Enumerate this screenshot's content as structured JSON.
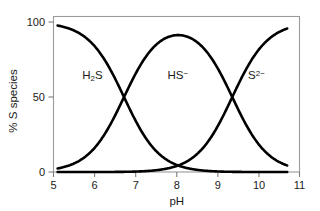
{
  "chart_data": {
    "type": "line",
    "title": "",
    "subtitle": "",
    "xlabel": "pH",
    "ylabel": "% S species",
    "xlim": [
      5,
      11
    ],
    "ylim": [
      0,
      100
    ],
    "xticks": [
      "5",
      "6",
      "7",
      "8",
      "9",
      "10",
      "11"
    ],
    "xtick_values": [
      5,
      6,
      7,
      8,
      9,
      10,
      11
    ],
    "yticks": [
      "0",
      "50",
      "100"
    ],
    "ytick_values": [
      0,
      50,
      100
    ],
    "grid": false,
    "legend": "none",
    "x_domain_drawn": [
      5.1,
      10.7
    ],
    "annotations": [
      {
        "id": "h2s",
        "text_html": "H<sub>2</sub>S",
        "text": "H2S",
        "x": 5.95,
        "y": 62
      },
      {
        "id": "hs-",
        "text_html": "HS<sup>−</sup>",
        "text": "HS-",
        "x": 8.03,
        "y": 62
      },
      {
        "id": "s2-",
        "text_html": "S<sup>2−</sup>",
        "text": "S2-",
        "x": 9.95,
        "y": 62
      }
    ],
    "series": [
      {
        "name": "H2S",
        "label_html": "H<sub>2</sub>S",
        "color": "#000000",
        "pka": 6.72,
        "shape": "descending sigmoid",
        "x": [
          5.1,
          5.3,
          5.5,
          5.7,
          5.9,
          6.1,
          6.3,
          6.5,
          6.72,
          6.9,
          7.1,
          7.3,
          7.5,
          7.7,
          7.9,
          8.1,
          8.3,
          8.6,
          9.0,
          9.5,
          10.0,
          10.7
        ],
        "values": [
          97.6,
          96.3,
          94.3,
          91.3,
          86.9,
          80.6,
          72.5,
          62.5,
          50.0,
          39.8,
          29.5,
          20.8,
          14.2,
          9.4,
          6.1,
          4.0,
          2.6,
          1.3,
          0.5,
          0.17,
          0.05,
          0.01
        ]
      },
      {
        "name": "HS-",
        "label_html": "HS<sup>−</sup>",
        "color": "#000000",
        "pka1": 6.72,
        "pka2": 9.36,
        "shape": "bell",
        "x": [
          5.1,
          5.5,
          5.9,
          6.3,
          6.72,
          7.1,
          7.5,
          7.9,
          8.1,
          8.3,
          8.6,
          8.9,
          9.1,
          9.36,
          9.6,
          9.9,
          10.2,
          10.45,
          10.7
        ],
        "values": [
          2.4,
          5.7,
          13.1,
          27.5,
          50.0,
          70.4,
          85.7,
          93.6,
          95.5,
          96.5,
          96.1,
          93.3,
          89.3,
          50.0,
          60.6,
          36.5,
          18.7,
          11.0,
          4.4
        ]
      },
      {
        "name": "S2-",
        "label_html": "S<sup>2−</sup>",
        "color": "#000000",
        "pka": 9.36,
        "shape": "ascending sigmoid",
        "x": [
          5.1,
          6.0,
          6.72,
          7.3,
          7.8,
          8.1,
          8.4,
          8.7,
          9.0,
          9.36,
          9.7,
          10.0,
          10.2,
          10.45,
          10.7
        ],
        "values": [
          0.0,
          0.0,
          0.05,
          0.2,
          0.6,
          1.2,
          2.4,
          4.6,
          9.6,
          50.0,
          69.0,
          81.3,
          87.2,
          92.0,
          95.6
        ]
      }
    ]
  },
  "figure": {
    "background": "#ffffff",
    "axis_color": "#8f8f8f",
    "curve_color": "#000000"
  }
}
